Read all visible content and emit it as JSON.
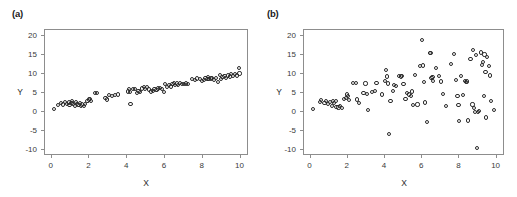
{
  "figure": {
    "background": "#ffffff",
    "marker_color": "#2b2b2b",
    "axis_color": "#8d8d8d"
  },
  "panels": [
    {
      "id": "a",
      "label": "(a)"
    },
    {
      "id": "b",
      "label": "(b)"
    }
  ],
  "axes": {
    "xlabel": "X",
    "ylabel": "Y",
    "xticks": [
      "0",
      "2",
      "4",
      "6",
      "8",
      "10"
    ],
    "yticks": [
      "20",
      "15",
      "10",
      "5",
      "0",
      "-5",
      "-10"
    ]
  },
  "chart_data": [
    {
      "type": "scatter",
      "panel": "(a)",
      "title": "",
      "xlabel": "X",
      "ylabel": "Y",
      "xlim": [
        -0.35,
        10.45
      ],
      "ylim": [
        -11.5,
        21.5
      ],
      "xticks": [
        0,
        2,
        4,
        6,
        8,
        10
      ],
      "yticks": [
        20,
        15,
        10,
        5,
        0,
        -5,
        -10
      ],
      "grid": false,
      "legend": null,
      "marker": "open-circle",
      "description": "Tight positive linear relationship with low scatter",
      "points": [
        [
          0.12,
          0.8
        ],
        [
          0.35,
          1.9
        ],
        [
          0.5,
          2.4
        ],
        [
          0.62,
          2.0
        ],
        [
          0.7,
          2.6
        ],
        [
          0.8,
          2.2
        ],
        [
          0.9,
          2.5
        ],
        [
          0.95,
          1.9
        ],
        [
          1.05,
          2.3
        ],
        [
          1.1,
          2.9
        ],
        [
          1.15,
          2.1
        ],
        [
          1.22,
          1.6
        ],
        [
          1.3,
          2.6
        ],
        [
          1.35,
          2.2
        ],
        [
          1.42,
          1.8
        ],
        [
          1.5,
          2.4
        ],
        [
          1.55,
          1.5
        ],
        [
          1.62,
          2.0
        ],
        [
          1.7,
          1.7
        ],
        [
          1.78,
          2.1
        ],
        [
          1.9,
          3.0
        ],
        [
          1.98,
          3.3
        ],
        [
          2.05,
          3.5
        ],
        [
          2.1,
          2.9
        ],
        [
          2.3,
          5.0
        ],
        [
          2.42,
          4.9
        ],
        [
          2.85,
          3.6
        ],
        [
          2.95,
          3.3
        ],
        [
          3.05,
          4.5
        ],
        [
          3.2,
          4.3
        ],
        [
          3.35,
          4.5
        ],
        [
          3.5,
          4.6
        ],
        [
          4.05,
          5.4
        ],
        [
          4.1,
          6.0
        ],
        [
          4.15,
          5.2
        ],
        [
          4.18,
          2.1
        ],
        [
          4.3,
          6.1
        ],
        [
          4.42,
          6.0
        ],
        [
          4.5,
          4.9
        ],
        [
          4.6,
          5.6
        ],
        [
          4.7,
          5.3
        ],
        [
          4.8,
          6.2
        ],
        [
          4.9,
          6.6
        ],
        [
          4.95,
          6.1
        ],
        [
          5.05,
          6.5
        ],
        [
          5.15,
          5.9
        ],
        [
          5.25,
          5.4
        ],
        [
          5.35,
          5.6
        ],
        [
          5.45,
          6.0
        ],
        [
          5.55,
          5.7
        ],
        [
          5.65,
          6.2
        ],
        [
          5.75,
          6.4
        ],
        [
          5.85,
          6.0
        ],
        [
          5.95,
          5.3
        ],
        [
          6.0,
          7.4
        ],
        [
          6.1,
          6.6
        ],
        [
          6.2,
          7.0
        ],
        [
          6.3,
          6.7
        ],
        [
          6.4,
          7.3
        ],
        [
          6.5,
          7.7
        ],
        [
          6.55,
          7.1
        ],
        [
          6.62,
          7.5
        ],
        [
          6.7,
          7.2
        ],
        [
          6.8,
          7.6
        ],
        [
          6.9,
          7.4
        ],
        [
          7.0,
          7.3
        ],
        [
          7.1,
          7.5
        ],
        [
          7.2,
          7.4
        ],
        [
          7.45,
          8.6
        ],
        [
          7.6,
          8.3
        ],
        [
          7.7,
          8.8
        ],
        [
          7.85,
          8.6
        ],
        [
          7.95,
          8.2
        ],
        [
          8.05,
          8.4
        ],
        [
          8.15,
          8.9
        ],
        [
          8.25,
          8.6
        ],
        [
          8.3,
          9.1
        ],
        [
          8.35,
          8.7
        ],
        [
          8.45,
          8.8
        ],
        [
          8.5,
          9.0
        ],
        [
          8.6,
          8.4
        ],
        [
          8.7,
          8.9
        ],
        [
          8.8,
          7.9
        ],
        [
          8.9,
          9.8
        ],
        [
          8.95,
          8.6
        ],
        [
          9.05,
          9.2
        ],
        [
          9.15,
          9.5
        ],
        [
          9.25,
          9.0
        ],
        [
          9.35,
          9.6
        ],
        [
          9.45,
          9.3
        ],
        [
          9.5,
          9.9
        ],
        [
          9.6,
          9.5
        ],
        [
          9.7,
          10.0
        ],
        [
          9.8,
          9.6
        ],
        [
          9.9,
          11.5
        ],
        [
          9.95,
          10.1
        ]
      ]
    },
    {
      "type": "scatter",
      "panel": "(b)",
      "title": "",
      "xlabel": "X",
      "ylabel": "Y",
      "xlim": [
        -0.35,
        10.45
      ],
      "ylim": [
        -11.5,
        21.5
      ],
      "xticks": [
        0,
        2,
        4,
        6,
        8,
        10
      ],
      "yticks": [
        20,
        15,
        10,
        5,
        0,
        -5,
        -10
      ],
      "grid": false,
      "legend": null,
      "marker": "open-circle",
      "description": "Positive relationship with variance increasing with X (heteroscedastic)",
      "points": [
        [
          0.12,
          0.8
        ],
        [
          0.5,
          2.6
        ],
        [
          0.58,
          3.2
        ],
        [
          0.75,
          2.4
        ],
        [
          0.85,
          2.9
        ],
        [
          0.95,
          2.2
        ],
        [
          1.05,
          2.7
        ],
        [
          1.15,
          1.6
        ],
        [
          1.2,
          3.0
        ],
        [
          1.28,
          2.4
        ],
        [
          1.35,
          2.8
        ],
        [
          1.4,
          1.3
        ],
        [
          1.5,
          1.2
        ],
        [
          1.6,
          1.5
        ],
        [
          1.68,
          1.1
        ],
        [
          1.8,
          3.4
        ],
        [
          1.9,
          3.6
        ],
        [
          1.95,
          4.6
        ],
        [
          2.0,
          4.2
        ],
        [
          2.05,
          3.2
        ],
        [
          2.3,
          7.6
        ],
        [
          2.45,
          7.6
        ],
        [
          2.5,
          3.3
        ],
        [
          2.6,
          2.4
        ],
        [
          2.85,
          5.0
        ],
        [
          2.95,
          7.5
        ],
        [
          3.05,
          4.8
        ],
        [
          3.1,
          0.5
        ],
        [
          3.3,
          5.2
        ],
        [
          3.45,
          5.6
        ],
        [
          3.55,
          7.7
        ],
        [
          3.85,
          4.6
        ],
        [
          4.0,
          8.2
        ],
        [
          4.05,
          11.0
        ],
        [
          4.1,
          9.3
        ],
        [
          4.15,
          7.5
        ],
        [
          4.2,
          -5.7
        ],
        [
          4.3,
          3.0
        ],
        [
          4.45,
          5.6
        ],
        [
          4.5,
          7.2
        ],
        [
          4.6,
          6.9
        ],
        [
          4.75,
          9.4
        ],
        [
          4.85,
          9.3
        ],
        [
          4.9,
          9.5
        ],
        [
          5.0,
          7.4
        ],
        [
          5.1,
          3.5
        ],
        [
          5.2,
          5.0
        ],
        [
          5.3,
          4.6
        ],
        [
          5.4,
          4.3
        ],
        [
          5.45,
          5.4
        ],
        [
          5.5,
          1.9
        ],
        [
          5.6,
          9.8
        ],
        [
          5.75,
          2.0
        ],
        [
          5.9,
          12.0
        ],
        [
          6.0,
          18.8
        ],
        [
          6.05,
          12.2
        ],
        [
          6.1,
          7.9
        ],
        [
          6.15,
          2.5
        ],
        [
          6.25,
          -2.7
        ],
        [
          6.4,
          15.4
        ],
        [
          6.45,
          15.4
        ],
        [
          6.5,
          8.9
        ],
        [
          6.55,
          9.2
        ],
        [
          6.6,
          8.2
        ],
        [
          6.75,
          11.5
        ],
        [
          6.9,
          9.5
        ],
        [
          7.0,
          8.0
        ],
        [
          7.1,
          4.7
        ],
        [
          7.3,
          1.7
        ],
        [
          7.55,
          12.7
        ],
        [
          7.7,
          15.3
        ],
        [
          7.8,
          8.5
        ],
        [
          7.9,
          4.2
        ],
        [
          7.95,
          1.8
        ],
        [
          8.0,
          -2.3
        ],
        [
          8.1,
          9.5
        ],
        [
          8.2,
          4.4
        ],
        [
          8.3,
          8.1
        ],
        [
          8.35,
          7.9
        ],
        [
          8.4,
          8.0
        ],
        [
          8.45,
          -2.2
        ],
        [
          8.6,
          14.0
        ],
        [
          8.7,
          2.0
        ],
        [
          8.75,
          16.2
        ],
        [
          8.8,
          1.1
        ],
        [
          8.85,
          0.0
        ],
        [
          8.9,
          15.0
        ],
        [
          8.95,
          -9.5
        ],
        [
          9.0,
          0.1
        ],
        [
          9.05,
          0.2
        ],
        [
          9.15,
          15.6
        ],
        [
          9.2,
          12.3
        ],
        [
          9.25,
          13.2
        ],
        [
          9.3,
          4.2
        ],
        [
          9.35,
          15.1
        ],
        [
          9.4,
          10.4
        ],
        [
          9.45,
          -1.4
        ],
        [
          9.5,
          14.4
        ],
        [
          9.6,
          12.0
        ],
        [
          9.65,
          9.6
        ],
        [
          9.7,
          3.0
        ],
        [
          9.85,
          0.6
        ]
      ]
    }
  ]
}
